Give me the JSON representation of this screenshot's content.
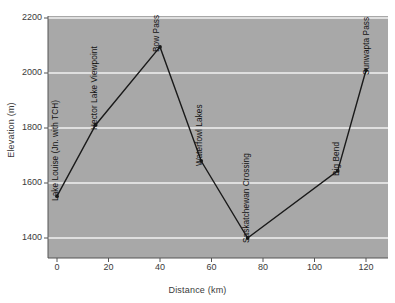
{
  "chart_data": {
    "type": "line",
    "title": "",
    "xlabel": "Distance (km)",
    "ylabel": "Elevation (m)",
    "xlim": [
      -2,
      127
    ],
    "ylim": [
      1330,
      2200
    ],
    "xticks": [
      0,
      20,
      40,
      60,
      80,
      100,
      120
    ],
    "yticks": [
      1400,
      1600,
      1800,
      2000,
      2200
    ],
    "grid": "horizontal",
    "legend": "none",
    "background_color": "#a8a8a8",
    "gridline_color": "#f2f2f2",
    "line_color": "#1a1a1a",
    "marker_color": "#1a1a1a",
    "x": [
      0,
      15,
      40,
      56,
      74,
      109,
      120
    ],
    "values": [
      1552,
      1811,
      2095,
      1680,
      1400,
      1644,
      2010
    ],
    "point_labels": [
      "Lake Louise (Jn. with TCH)",
      "Hector Lake Viewpoint",
      "Bow Pass",
      "Waterfowl Lakes",
      "Saskatchewan Crossing",
      "Big Bend",
      "Sunwapta Pass"
    ],
    "points": [
      {
        "label": "Lake Louise (Jn. with TCH)",
        "x": 0,
        "y": 1552
      },
      {
        "label": "Hector Lake Viewpoint",
        "x": 15,
        "y": 1811
      },
      {
        "label": "Bow Pass",
        "x": 40,
        "y": 2095
      },
      {
        "label": "Waterfowl Lakes",
        "x": 56,
        "y": 1680
      },
      {
        "label": "Saskatchewan Crossing",
        "x": 74,
        "y": 1400
      },
      {
        "label": "Big Bend",
        "x": 109,
        "y": 1644
      },
      {
        "label": "Sunwapta Pass",
        "x": 120,
        "y": 2010
      }
    ]
  },
  "axes": {
    "y_tick_labels": [
      "2200",
      "2000",
      "1800",
      "1600",
      "1400"
    ],
    "x_tick_labels": [
      "0",
      "20",
      "40",
      "60",
      "80",
      "100",
      "120"
    ],
    "y_title": "Elevation (m)",
    "x_title": "Distance (km)"
  }
}
